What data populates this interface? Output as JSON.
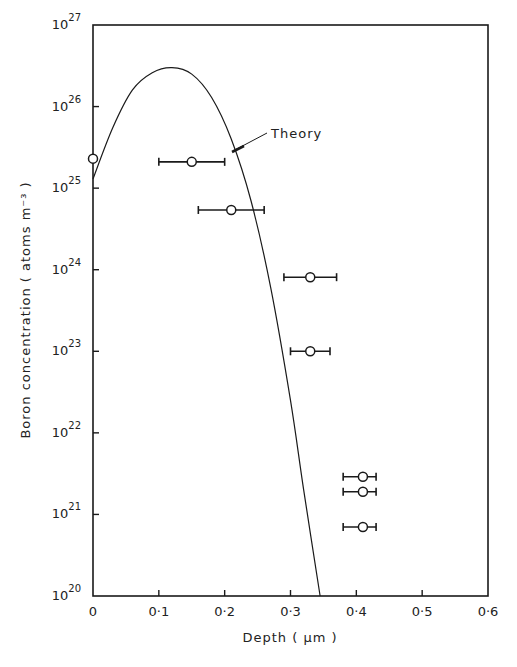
{
  "chart_data": {
    "type": "scatter",
    "title": "",
    "xlabel": "Depth ( μm )",
    "ylabel": "Boron concentration ( atoms m⁻³ )",
    "xlim": [
      0,
      0.6
    ],
    "ylim": [
      1e+20,
      1e+27
    ],
    "yscale": "log",
    "x_ticks": [
      "0",
      "0·1",
      "0·2",
      "0·3",
      "0·4",
      "0·5",
      "0·6"
    ],
    "y_ticks": [
      {
        "base": "10",
        "exp": "20"
      },
      {
        "base": "10",
        "exp": "21"
      },
      {
        "base": "10",
        "exp": "22"
      },
      {
        "base": "10",
        "exp": "23"
      },
      {
        "base": "10",
        "exp": "24"
      },
      {
        "base": "10",
        "exp": "25"
      },
      {
        "base": "10",
        "exp": "26"
      },
      {
        "base": "10",
        "exp": "27"
      }
    ],
    "grid": false,
    "annotation": "Theory",
    "series": [
      {
        "name": "Experiment",
        "marker": "open-circle",
        "points": [
          {
            "x": 0.0,
            "y": 2.3e+25,
            "xerr": [
              0.0,
              0.0
            ]
          },
          {
            "x": 0.15,
            "y": 2.1e+25,
            "xerr": [
              0.1,
              0.2
            ]
          },
          {
            "x": 0.21,
            "y": 5.4e+24,
            "xerr": [
              0.16,
              0.26
            ]
          },
          {
            "x": 0.33,
            "y": 8.1e+23,
            "xerr": [
              0.29,
              0.37
            ]
          },
          {
            "x": 0.33,
            "y": 1e+23,
            "xerr": [
              0.3,
              0.36
            ]
          },
          {
            "x": 0.41,
            "y": 2.9e+21,
            "xerr": [
              0.38,
              0.43
            ]
          },
          {
            "x": 0.41,
            "y": 1.9e+21,
            "xerr": [
              0.38,
              0.43
            ]
          },
          {
            "x": 0.41,
            "y": 7e+20,
            "xerr": [
              0.38,
              0.43
            ]
          }
        ]
      },
      {
        "name": "Theory",
        "type": "line",
        "points": [
          {
            "x": 0.0,
            "y": 1.3e+25
          },
          {
            "x": 0.03,
            "y": 5.5e+25
          },
          {
            "x": 0.06,
            "y": 1.6e+26
          },
          {
            "x": 0.09,
            "y": 2.6e+26
          },
          {
            "x": 0.12,
            "y": 3e+26
          },
          {
            "x": 0.15,
            "y": 2.5e+26
          },
          {
            "x": 0.18,
            "y": 1.3e+26
          },
          {
            "x": 0.21,
            "y": 4e+25
          },
          {
            "x": 0.24,
            "y": 7e+24
          },
          {
            "x": 0.27,
            "y": 6e+23
          },
          {
            "x": 0.3,
            "y": 2.5e+22
          },
          {
            "x": 0.32,
            "y": 2e+21
          },
          {
            "x": 0.345,
            "y": 1e+20
          }
        ]
      }
    ]
  }
}
